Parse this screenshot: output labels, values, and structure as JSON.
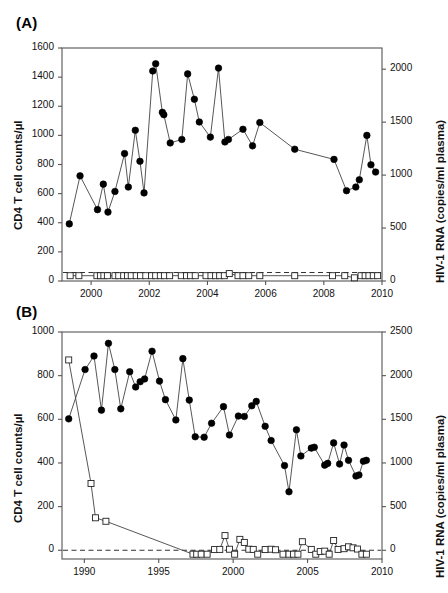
{
  "figure": {
    "background": "#ffffff",
    "marker_filled_color": "#000000",
    "marker_open_fill": "#ffffff",
    "line_color": "#444444",
    "axis_color": "#555555",
    "dashed_line_color": "#333333"
  },
  "panels": [
    {
      "label": "(A)",
      "ylabel_left": "CD4 T cell counts/µl",
      "ylabel_right": "HIV-1 RNA (copies/ml plasma)"
    },
    {
      "label": "(B)",
      "ylabel_left": "CD4 T cell counts/µl",
      "ylabel_right": "HIV-1 RNA (copies/ml plasma)"
    }
  ],
  "chart_data": [
    {
      "type": "line",
      "panel": "A",
      "title": "(A)",
      "xlabel": "",
      "ylabel": "CD4 T cell counts/µl",
      "ylabel_right": "HIV-1 RNA (copies/ml plasma)",
      "xlim": [
        1999.0,
        2010.0
      ],
      "ylim": [
        0,
        1600
      ],
      "ylim_right": [
        0,
        2200
      ],
      "xticks": [
        2000,
        2002,
        2004,
        2006,
        2008,
        2010
      ],
      "yticks_left": [
        0,
        200,
        400,
        600,
        800,
        1000,
        1200,
        1400,
        1600
      ],
      "yticks_right": [
        0,
        500,
        1000,
        1500,
        2000
      ],
      "grid": false,
      "legend": "none",
      "annotations": [
        {
          "kind": "dashed-reference-line",
          "value_right": 80,
          "style": "dashed"
        }
      ],
      "series": [
        {
          "name": "CD4 T cell counts",
          "axis": "left",
          "marker": "filled-circle",
          "x": [
            1999.25,
            1999.62,
            2000.22,
            2000.42,
            2000.58,
            2000.82,
            2001.15,
            2001.28,
            2001.52,
            2001.68,
            2001.82,
            2002.12,
            2002.22,
            2002.45,
            2002.5,
            2002.72,
            2003.12,
            2003.32,
            2003.55,
            2003.72,
            2004.1,
            2004.38,
            2004.6,
            2004.72,
            2005.22,
            2005.55,
            2005.8,
            2007.0,
            2008.35,
            2008.78,
            2009.1,
            2009.22,
            2009.48,
            2009.62,
            2009.78
          ],
          "y": [
            392,
            722,
            490,
            665,
            473,
            615,
            875,
            645,
            1035,
            822,
            605,
            1442,
            1492,
            1158,
            1142,
            948,
            972,
            1422,
            1248,
            1092,
            988,
            1462,
            955,
            972,
            1042,
            928,
            1088,
            905,
            835,
            620,
            645,
            695,
            1000,
            798,
            748
          ]
        },
        {
          "name": "HIV-1 RNA viral load",
          "axis": "right",
          "marker": "open-square",
          "x": [
            1999.28,
            1999.58,
            2000.2,
            2000.32,
            2000.44,
            2000.56,
            2000.82,
            2000.95,
            2001.12,
            2001.25,
            2001.38,
            2001.55,
            2001.7,
            2001.88,
            2002.08,
            2002.22,
            2002.38,
            2002.52,
            2002.7,
            2003.1,
            2003.28,
            2003.42,
            2003.58,
            2003.95,
            2004.12,
            2004.28,
            2004.42,
            2004.58,
            2004.75,
            2005.05,
            2005.22,
            2005.42,
            2005.8,
            2007.0,
            2008.3,
            2008.72,
            2009.05,
            2009.28,
            2009.42,
            2009.55,
            2009.7,
            2009.85
          ],
          "y": [
            50,
            50,
            50,
            50,
            50,
            50,
            50,
            50,
            50,
            50,
            50,
            50,
            50,
            50,
            50,
            50,
            50,
            50,
            50,
            50,
            50,
            50,
            50,
            50,
            50,
            50,
            50,
            50,
            70,
            50,
            50,
            50,
            50,
            50,
            50,
            50,
            30,
            50,
            50,
            50,
            50,
            50
          ]
        }
      ]
    },
    {
      "type": "line",
      "panel": "B",
      "title": "(B)",
      "xlabel": "",
      "ylabel": "CD4 T cell counts/µl",
      "ylabel_right": "HIV-1 RNA (copies/ml plasma)",
      "xlim": [
        1988.5,
        2010.0
      ],
      "ylim": [
        -40,
        1000
      ],
      "ylim_right": [
        -100,
        2500
      ],
      "xticks": [
        1990,
        1995,
        2000,
        2005,
        2010
      ],
      "yticks_left": [
        0,
        200,
        400,
        600,
        800,
        1000
      ],
      "yticks_right": [
        0,
        500,
        1000,
        1500,
        2000,
        2500
      ],
      "grid": false,
      "legend": "none",
      "annotations": [
        {
          "kind": "dashed-reference-line",
          "value_left": 0,
          "style": "dashed"
        }
      ],
      "series": [
        {
          "name": "CD4 T cell counts",
          "axis": "left",
          "marker": "filled-circle",
          "x": [
            1988.95,
            1990.05,
            1990.65,
            1991.15,
            1991.62,
            1992.05,
            1992.45,
            1993.05,
            1993.45,
            1993.75,
            1994.05,
            1994.55,
            1995.05,
            1995.45,
            1996.15,
            1996.62,
            1997.05,
            1997.45,
            1998.05,
            1998.55,
            1999.35,
            1999.75,
            2000.35,
            2000.75,
            2001.25,
            2001.55,
            2002.15,
            2002.55,
            2003.45,
            2003.75,
            2004.25,
            2004.55,
            2005.25,
            2005.45,
            2006.15,
            2006.35,
            2006.75,
            2007.15,
            2007.45,
            2007.75,
            2008.25,
            2008.45,
            2008.75,
            2008.95
          ],
          "y": [
            602,
            828,
            890,
            642,
            948,
            828,
            648,
            818,
            748,
            772,
            785,
            912,
            775,
            690,
            597,
            878,
            688,
            520,
            518,
            582,
            658,
            528,
            615,
            613,
            662,
            682,
            568,
            503,
            388,
            268,
            552,
            432,
            468,
            472,
            390,
            398,
            492,
            395,
            482,
            412,
            340,
            345,
            408,
            412
          ]
        },
        {
          "name": "HIV-1 RNA viral load",
          "axis": "right",
          "marker": "open-square",
          "x": [
            1988.95,
            1990.45,
            1990.75,
            1991.45,
            1997.3,
            1997.55,
            1997.85,
            1998.25,
            1998.75,
            1999.1,
            1999.45,
            1999.75,
            2000.1,
            2000.45,
            2000.75,
            2001.05,
            2001.35,
            2001.65,
            2002.15,
            2002.55,
            2002.85,
            2003.35,
            2003.75,
            2004.05,
            2004.35,
            2004.65,
            2005.25,
            2005.55,
            2005.85,
            2006.15,
            2006.45,
            2006.75,
            2007.05,
            2007.45,
            2007.75,
            2008.05,
            2008.35,
            2008.65,
            2008.95
          ],
          "y": [
            2180,
            765,
            372,
            332,
            -45,
            -45,
            -45,
            -45,
            8,
            10,
            168,
            12,
            -45,
            125,
            90,
            12,
            10,
            -45,
            8,
            12,
            6,
            -45,
            -45,
            -45,
            -45,
            98,
            10,
            -45,
            -15,
            -10,
            -45,
            112,
            10,
            18,
            40,
            28,
            14,
            -45,
            -45
          ]
        }
      ]
    }
  ]
}
